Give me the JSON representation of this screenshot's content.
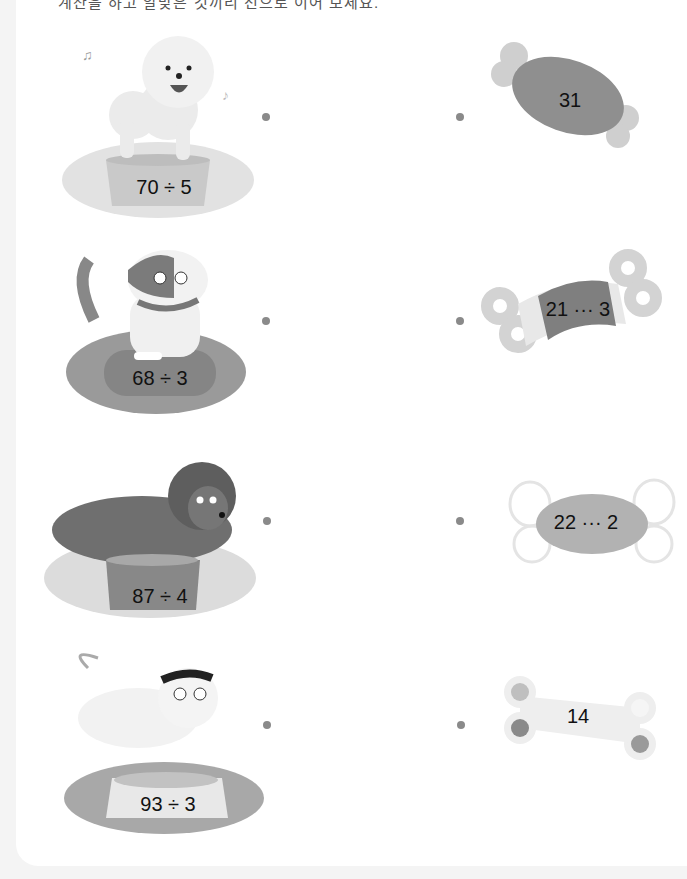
{
  "header": {
    "text": "계산을 하고 알맞은 것끼리 선으로 이어 보세요."
  },
  "left_items": [
    {
      "dog": "white-fluffy-dog",
      "expression": "70 ÷ 5"
    },
    {
      "dog": "spotted-dog-with-collar",
      "expression": "68 ÷ 3"
    },
    {
      "dog": "brown-poodle-lying",
      "expression": "87 ÷ 4"
    },
    {
      "dog": "white-dog-with-sunglasses",
      "expression": "93 ÷ 3"
    }
  ],
  "right_items": [
    {
      "shape": "meat-bone",
      "answer": "31"
    },
    {
      "shape": "bandaged-bone",
      "answer": "21 ··· 3"
    },
    {
      "shape": "wrapped-candy",
      "answer": "22 ··· 2"
    },
    {
      "shape": "bone-biscuit",
      "answer": "14"
    }
  ],
  "colors": {
    "dot": "#8a8a8a",
    "text": "#111111"
  }
}
